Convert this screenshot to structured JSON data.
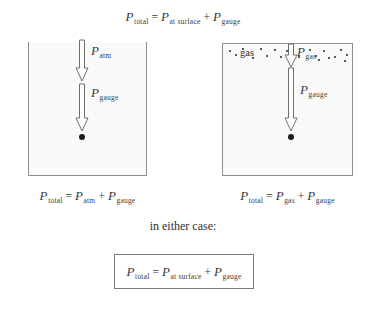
{
  "diagram": {
    "title_equation": {
      "lhs": "P",
      "lhs_sub": "total",
      "eq": "=",
      "t1": "P",
      "t1_sub": "at surface",
      "plus": "+",
      "t2": "P",
      "t2_sub": "gauge"
    },
    "left_panel": {
      "name": "open-container",
      "arrows": [
        {
          "label_var": "P",
          "label_sub": "atm",
          "icon": "down-arrow-icon"
        },
        {
          "label_var": "P",
          "label_sub": "gauge",
          "icon": "down-arrow-icon"
        }
      ],
      "point_marker": "measurement-point-dot",
      "caption": {
        "lhs": "P",
        "lhs_sub": "total",
        "eq": "=",
        "t1": "P",
        "t1_sub": "atm",
        "plus": "+",
        "t2": "P",
        "t2_sub": "gauge"
      }
    },
    "right_panel": {
      "name": "closed-gas-container",
      "gas_label": "gas",
      "arrows": [
        {
          "label_var": "P",
          "label_sub": "gas",
          "icon": "down-arrow-icon"
        },
        {
          "label_var": "P",
          "label_sub": "gauge",
          "icon": "down-arrow-icon"
        }
      ],
      "point_marker": "measurement-point-dot",
      "caption": {
        "lhs": "P",
        "lhs_sub": "total",
        "eq": "=",
        "t1": "P",
        "t1_sub": "gas",
        "plus": "+",
        "t2": "P",
        "t2_sub": "gauge"
      }
    },
    "summary": {
      "heading": "in either case:",
      "boxed_equation": {
        "lhs": "P",
        "lhs_sub": "total",
        "eq": "=",
        "t1": "P",
        "t1_sub": "at surface",
        "plus": "+",
        "t2": "P",
        "t2_sub": "gauge"
      }
    },
    "colors": {
      "ink": "#2b2b2b",
      "outline": "#6f6f6f",
      "container_fill": "#fafafa",
      "container_border": "#8e8e8e",
      "dot": "#1a1a1a"
    },
    "gas_dots": [
      [
        7,
        7
      ],
      [
        13,
        11
      ],
      [
        38,
        5
      ],
      [
        44,
        12
      ],
      [
        52,
        6
      ],
      [
        58,
        13
      ],
      [
        64,
        7
      ],
      [
        87,
        6
      ],
      [
        93,
        12
      ],
      [
        101,
        7
      ],
      [
        112,
        13
      ],
      [
        118,
        6
      ],
      [
        124,
        11
      ],
      [
        30,
        14
      ],
      [
        76,
        13
      ],
      [
        106,
        14
      ],
      [
        20,
        5
      ],
      [
        68,
        15
      ],
      [
        96,
        16
      ],
      [
        122,
        17
      ]
    ]
  }
}
